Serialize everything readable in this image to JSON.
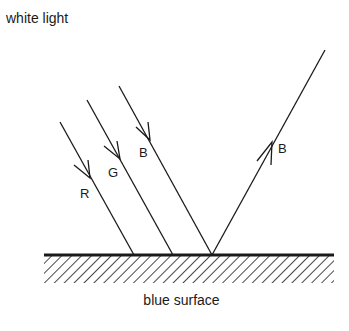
{
  "title": "white light",
  "caption": "blue surface",
  "rays": {
    "incident": [
      {
        "label": "R",
        "color_name": "red"
      },
      {
        "label": "G",
        "color_name": "green"
      },
      {
        "label": "B",
        "color_name": "blue"
      }
    ],
    "reflected": {
      "label": "B",
      "color_name": "blue"
    }
  },
  "colors": {
    "ink": "#1a1a1a",
    "background": "#ffffff"
  }
}
